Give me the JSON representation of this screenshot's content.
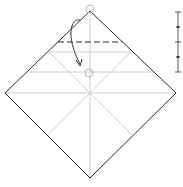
{
  "diagram": {
    "type": "origami-fold-step",
    "colors": {
      "outline": "#222222",
      "crease": "#bbbbbb",
      "dashed_fold": "#222222",
      "arrow": "#333333",
      "marker": "#999999"
    },
    "fold_line": "valley (dashed)",
    "arrow": "fold top corner down to marked point",
    "scale_marks": 5
  }
}
